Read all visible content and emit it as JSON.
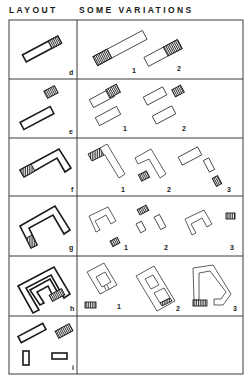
{
  "header": {
    "layout_label": "LAYOUT",
    "variations_label": "SOME VARIATIONS"
  },
  "rows": [
    {
      "id": "d",
      "layout_label": "d",
      "variation_labels": [
        "1",
        "2"
      ],
      "description": "single linear block with hatched end"
    },
    {
      "id": "e",
      "layout_label": "e",
      "variation_labels": [
        "1",
        "2"
      ],
      "description": "linear block plus separate hatched block"
    },
    {
      "id": "f",
      "layout_label": "f",
      "variation_labels": [
        "1",
        "2",
        "3"
      ],
      "description": "L-shaped block"
    },
    {
      "id": "g",
      "layout_label": "g",
      "variation_labels": [
        "1",
        "2",
        "3"
      ],
      "description": "U-shaped block"
    },
    {
      "id": "h",
      "layout_label": "h",
      "variation_labels": [
        "1",
        "2",
        "3"
      ],
      "description": "nested courtyard block"
    },
    {
      "id": "i",
      "layout_label": "i",
      "variation_labels": [],
      "description": "scattered separate blocks"
    }
  ],
  "colors": {
    "ink": "#1a1a1a",
    "background": "#ffffff"
  }
}
